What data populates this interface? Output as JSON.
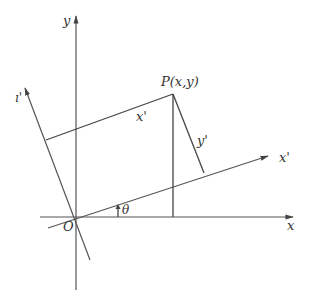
{
  "diagram": {
    "labels": {
      "x_axis": "x",
      "y_axis": "y",
      "x_prime_axis": "x'",
      "y_prime_axis": "ı'",
      "origin": "O",
      "angle": "θ",
      "point": "P(x,y)",
      "x_prime_segment": "x'",
      "y_prime_segment": "y'"
    },
    "colors": {
      "line": "#444444",
      "text": "#333333",
      "background": "#ffffff"
    }
  }
}
